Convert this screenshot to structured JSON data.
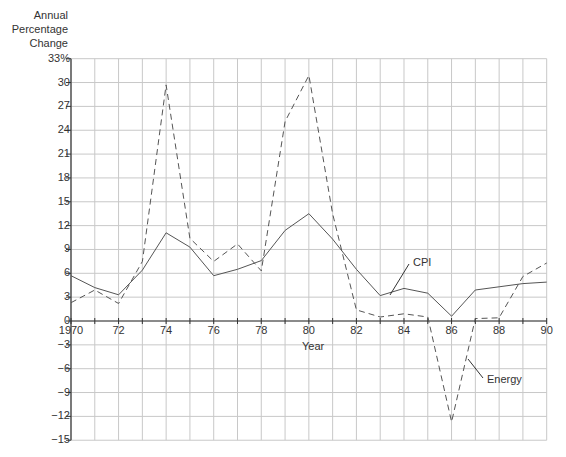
{
  "chart_data": {
    "type": "line",
    "title": "",
    "ylabel": "Annual Percentage Change",
    "xlabel": "Year",
    "x": [
      1970,
      1971,
      1972,
      1973,
      1974,
      1975,
      1976,
      1977,
      1978,
      1979,
      1980,
      1981,
      1982,
      1983,
      1984,
      1985,
      1986,
      1987,
      1988,
      1989,
      1990
    ],
    "xticks": [
      {
        "value": 1970,
        "label": "1970"
      },
      {
        "value": 1972,
        "label": "72"
      },
      {
        "value": 1974,
        "label": "74"
      },
      {
        "value": 1976,
        "label": "76"
      },
      {
        "value": 1978,
        "label": "78"
      },
      {
        "value": 1980,
        "label": "80"
      },
      {
        "value": 1982,
        "label": "82"
      },
      {
        "value": 1984,
        "label": "84"
      },
      {
        "value": 1986,
        "label": "86"
      },
      {
        "value": 1988,
        "label": "88"
      },
      {
        "value": 1990,
        "label": "90"
      }
    ],
    "yticks": [
      {
        "value": 33,
        "label": "33%"
      },
      {
        "value": 30,
        "label": "30"
      },
      {
        "value": 27,
        "label": "27"
      },
      {
        "value": 24,
        "label": "24"
      },
      {
        "value": 21,
        "label": "21"
      },
      {
        "value": 18,
        "label": "18"
      },
      {
        "value": 15,
        "label": "15"
      },
      {
        "value": 12,
        "label": "12"
      },
      {
        "value": 9,
        "label": "9"
      },
      {
        "value": 6,
        "label": "6"
      },
      {
        "value": 3,
        "label": "3"
      },
      {
        "value": 0,
        "label": "0"
      },
      {
        "value": -3,
        "label": "−3"
      },
      {
        "value": -6,
        "label": "−6"
      },
      {
        "value": -9,
        "label": "−9"
      },
      {
        "value": -12,
        "label": "−12"
      },
      {
        "value": -15,
        "label": "−15"
      }
    ],
    "ylim": [
      -15,
      33
    ],
    "xlim": [
      1970,
      1990
    ],
    "grid": true,
    "legend": "inline annotations",
    "series": [
      {
        "name": "CPI",
        "style": "solid",
        "values": [
          5.7,
          4.2,
          3.3,
          6.4,
          11.1,
          9.3,
          5.7,
          6.5,
          7.6,
          11.4,
          13.5,
          10.3,
          6.5,
          3.2,
          4.1,
          3.5,
          0.6,
          3.9,
          4.3,
          4.7,
          4.9
        ]
      },
      {
        "name": "Energy",
        "style": "dashed",
        "values": [
          2.3,
          3.9,
          2.2,
          7.5,
          29.7,
          10.4,
          7.5,
          9.7,
          6.3,
          25.1,
          30.9,
          13.5,
          1.4,
          0.5,
          0.9,
          0.5,
          -12.7,
          0.3,
          0.4,
          5.6,
          7.3
        ]
      }
    ],
    "annotations": [
      {
        "text": "CPI",
        "series": "CPI",
        "x": 1983.3
      },
      {
        "text": "Energy",
        "series": "Energy",
        "x": 1986.7
      }
    ]
  },
  "labels": {
    "y_title_line1": "Annual",
    "y_title_line2": "Percentage",
    "y_title_line3": "Change",
    "x_title": "Year",
    "cpi": "CPI",
    "energy": "Energy"
  }
}
